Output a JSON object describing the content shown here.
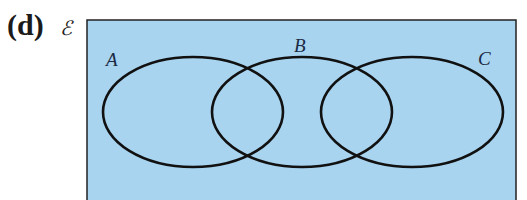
{
  "figure": {
    "part_label": "(d)",
    "universal_set_symbol": "ℰ",
    "background_color": "#a8d4f0",
    "outline_color": "#111111",
    "sets": [
      {
        "label": "A",
        "cx": 193,
        "cy": 112,
        "rx": 90,
        "ry": 55
      },
      {
        "label": "B",
        "cx": 302,
        "cy": 112,
        "rx": 90,
        "ry": 55
      },
      {
        "label": "C",
        "cx": 412,
        "cy": 112,
        "rx": 91,
        "ry": 55
      }
    ]
  }
}
